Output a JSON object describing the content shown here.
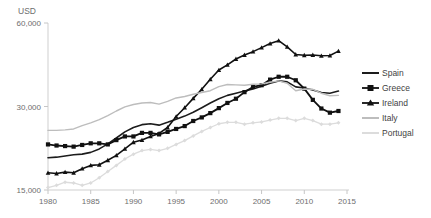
{
  "chart_data": {
    "type": "line",
    "title": "",
    "subtitle": "",
    "xlabel": "",
    "ylabel": "USD",
    "yscale": "log",
    "ylim": [
      15000,
      60000
    ],
    "xlim": [
      1980,
      2015
    ],
    "grid": false,
    "legend_position": "right",
    "ytick_labels": [
      "60,000",
      "30,000",
      "15,000"
    ],
    "ytick_values": [
      60000,
      30000,
      15000
    ],
    "xtick_labels": [
      "1980",
      "1985",
      "1990",
      "1995",
      "2000",
      "2005",
      "2010",
      "2015"
    ],
    "xtick_values": [
      1980,
      1985,
      1990,
      1995,
      2000,
      2005,
      2010,
      2015
    ],
    "x": [
      1980,
      1981,
      1982,
      1983,
      1984,
      1985,
      1986,
      1987,
      1988,
      1989,
      1990,
      1991,
      1992,
      1993,
      1994,
      1995,
      1996,
      1997,
      1998,
      1999,
      2000,
      2001,
      2002,
      2003,
      2004,
      2005,
      2006,
      2007,
      2008,
      2009,
      2010,
      2011,
      2012,
      2013,
      2014
    ],
    "series": [
      {
        "name": "Spain",
        "color": "#1c1c1c",
        "marker": "none",
        "width": 1.6,
        "values": [
          19600,
          19700,
          19900,
          20100,
          20200,
          20500,
          21100,
          22000,
          23100,
          24300,
          25200,
          25800,
          26000,
          25700,
          26300,
          27000,
          27700,
          28600,
          29700,
          30900,
          32000,
          32900,
          33500,
          34100,
          34700,
          35500,
          36400,
          37100,
          36800,
          35300,
          35000,
          34400,
          33700,
          33500,
          34100
        ]
      },
      {
        "name": "Greece",
        "color": "#111111",
        "marker": "square",
        "width": 1.8,
        "values": [
          21900,
          21700,
          21600,
          21500,
          21800,
          22100,
          22100,
          21900,
          22700,
          23400,
          23400,
          24100,
          24100,
          23800,
          24300,
          24900,
          25500,
          26600,
          27400,
          28400,
          29600,
          30900,
          32000,
          33800,
          35300,
          35800,
          37500,
          38400,
          38400,
          37300,
          34800,
          31700,
          29500,
          28500,
          28900
        ]
      },
      {
        "name": "Ireland",
        "color": "#111111",
        "marker": "triangle",
        "width": 1.6,
        "values": [
          17300,
          17200,
          17400,
          17300,
          17900,
          18400,
          18500,
          19200,
          20000,
          21100,
          22300,
          22700,
          23400,
          24000,
          25200,
          27600,
          29700,
          32100,
          34600,
          37600,
          40600,
          42400,
          44500,
          46000,
          47300,
          48900,
          50600,
          51800,
          49200,
          46200,
          45900,
          46000,
          45700,
          45800,
          47500
        ]
      },
      {
        "name": "Italy",
        "color": "#bdbdbd",
        "marker": "none",
        "width": 1.4,
        "values": [
          24600,
          24600,
          24700,
          24900,
          25600,
          26200,
          26900,
          27800,
          28900,
          29900,
          30500,
          30900,
          31000,
          30600,
          31300,
          32200,
          32600,
          33200,
          33700,
          34200,
          35400,
          36000,
          35900,
          35800,
          36100,
          36200,
          36700,
          37100,
          36400,
          34200,
          34700,
          34600,
          33500,
          32800,
          32900
        ]
      },
      {
        "name": "Portugal",
        "color": "#dcdcdc",
        "marker": "diamond",
        "width": 1.3,
        "values": [
          15300,
          15600,
          16000,
          15900,
          15600,
          15900,
          16600,
          17500,
          18400,
          19400,
          20200,
          20800,
          21000,
          20800,
          21200,
          21900,
          22600,
          23500,
          24400,
          25200,
          26000,
          26300,
          26300,
          25900,
          26200,
          26400,
          26800,
          27200,
          27200,
          26700,
          27200,
          26700,
          25900,
          25900,
          26200
        ]
      }
    ],
    "legend_entries": [
      {
        "label": "Spain",
        "color": "#1c1c1c",
        "marker": "none"
      },
      {
        "label": "Greece",
        "color": "#111111",
        "marker": "square"
      },
      {
        "label": "Ireland",
        "color": "#111111",
        "marker": "triangle"
      },
      {
        "label": "Italy",
        "color": "#bdbdbd",
        "marker": "none"
      },
      {
        "label": "Portugal",
        "color": "#dcdcdc",
        "marker": "none"
      }
    ]
  }
}
